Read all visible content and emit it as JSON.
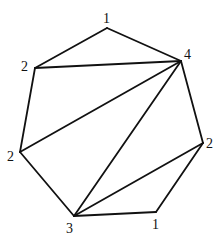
{
  "diagram": {
    "title": "",
    "vertices": [
      {
        "id": "v0",
        "label": "1",
        "x": 107,
        "y": 28,
        "lx": 103,
        "ly": 23
      },
      {
        "id": "v1",
        "label": "4",
        "x": 181,
        "y": 61,
        "lx": 184,
        "ly": 59
      },
      {
        "id": "v2",
        "label": "2",
        "x": 203,
        "y": 143,
        "lx": 206,
        "ly": 148
      },
      {
        "id": "v3",
        "label": "1",
        "x": 156,
        "y": 212,
        "lx": 152,
        "ly": 229
      },
      {
        "id": "v4",
        "label": "3",
        "x": 74,
        "y": 216,
        "lx": 66,
        "ly": 233
      },
      {
        "id": "v5",
        "label": "2",
        "x": 20,
        "y": 152,
        "lx": 7,
        "ly": 161
      },
      {
        "id": "v6",
        "label": "2",
        "x": 35,
        "y": 68,
        "lx": 21,
        "ly": 71
      }
    ],
    "polygon_edges": [
      [
        "v0",
        "v1"
      ],
      [
        "v1",
        "v2"
      ],
      [
        "v2",
        "v3"
      ],
      [
        "v3",
        "v4"
      ],
      [
        "v4",
        "v5"
      ],
      [
        "v5",
        "v6"
      ],
      [
        "v6",
        "v0"
      ]
    ],
    "diagonals": [
      [
        "v6",
        "v1"
      ],
      [
        "v5",
        "v1"
      ],
      [
        "v4",
        "v1"
      ],
      [
        "v4",
        "v2"
      ]
    ]
  }
}
